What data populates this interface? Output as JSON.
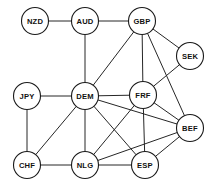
{
  "diagram": {
    "type": "undirected-graph",
    "canvas": {
      "width": 217,
      "height": 188
    },
    "style": {
      "background_color": "#ffffff",
      "node_fill": "#ffffff",
      "node_stroke": "#1a1a1a",
      "edge_color": "#262626",
      "label_color": "#111111",
      "node_radius": 13.5
    },
    "nodes": [
      {
        "id": "NZD",
        "label": "NZD",
        "x": 35,
        "y": 21
      },
      {
        "id": "AUD",
        "label": "AUD",
        "x": 85,
        "y": 21
      },
      {
        "id": "GBP",
        "label": "GBP",
        "x": 142,
        "y": 21
      },
      {
        "id": "SEK",
        "label": "SEK",
        "x": 190,
        "y": 56
      },
      {
        "id": "JPY",
        "label": "JPY",
        "x": 27,
        "y": 96
      },
      {
        "id": "DEM",
        "label": "DEM",
        "x": 85,
        "y": 96
      },
      {
        "id": "FRF",
        "label": "FRF",
        "x": 143,
        "y": 95
      },
      {
        "id": "BEF",
        "label": "BEF",
        "x": 190,
        "y": 128
      },
      {
        "id": "CHF",
        "label": "CHF",
        "x": 27,
        "y": 165
      },
      {
        "id": "NLG",
        "label": "NLG",
        "x": 85,
        "y": 165
      },
      {
        "id": "ESP",
        "label": "ESP",
        "x": 145,
        "y": 165
      }
    ],
    "edges": [
      {
        "source": "NZD",
        "target": "AUD"
      },
      {
        "source": "AUD",
        "target": "GBP"
      },
      {
        "source": "AUD",
        "target": "DEM"
      },
      {
        "source": "GBP",
        "target": "SEK"
      },
      {
        "source": "GBP",
        "target": "FRF"
      },
      {
        "source": "GBP",
        "target": "DEM"
      },
      {
        "source": "GBP",
        "target": "BEF"
      },
      {
        "source": "SEK",
        "target": "FRF"
      },
      {
        "source": "JPY",
        "target": "DEM"
      },
      {
        "source": "JPY",
        "target": "CHF"
      },
      {
        "source": "DEM",
        "target": "FRF"
      },
      {
        "source": "DEM",
        "target": "CHF"
      },
      {
        "source": "DEM",
        "target": "NLG"
      },
      {
        "source": "DEM",
        "target": "ESP"
      },
      {
        "source": "DEM",
        "target": "BEF"
      },
      {
        "source": "FRF",
        "target": "NLG"
      },
      {
        "source": "FRF",
        "target": "ESP"
      },
      {
        "source": "FRF",
        "target": "BEF"
      },
      {
        "source": "CHF",
        "target": "NLG"
      },
      {
        "source": "NLG",
        "target": "ESP"
      },
      {
        "source": "NLG",
        "target": "BEF"
      },
      {
        "source": "ESP",
        "target": "BEF"
      }
    ]
  }
}
